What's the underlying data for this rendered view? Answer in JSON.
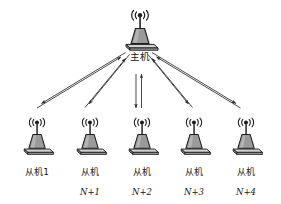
{
  "diagram": {
    "type": "star-network-topology",
    "background_color": "#ffffff",
    "line_color": "#2b2b2b",
    "icon_body_color": "#9a9a9a",
    "icon_base_color": "#c9c9c9",
    "icon_outline_color": "#1e1e1e",
    "master": {
      "id": "master",
      "label": "主机",
      "icon": "wireless-base-station-icon"
    },
    "slaves": [
      {
        "id": "slave-1",
        "label_line1": "从机1",
        "label_line2": "",
        "icon": "wireless-base-station-icon"
      },
      {
        "id": "slave-n1",
        "label_line1": "从机",
        "label_line2": "N+1",
        "icon": "wireless-base-station-icon"
      },
      {
        "id": "slave-n2",
        "label_line1": "从机",
        "label_line2": "N+2",
        "icon": "wireless-base-station-icon"
      },
      {
        "id": "slave-n3",
        "label_line1": "从机",
        "label_line2": "N+3",
        "icon": "wireless-base-station-icon"
      },
      {
        "id": "slave-n4",
        "label_line1": "从机",
        "label_line2": "N+4",
        "icon": "wireless-base-station-icon"
      }
    ],
    "links": [
      {
        "from": "master",
        "to": "slave-1",
        "style": "double-arrow-pair",
        "direction": "bidirectional"
      },
      {
        "from": "master",
        "to": "slave-n1",
        "style": "double-arrow-pair",
        "direction": "bidirectional"
      },
      {
        "from": "master",
        "to": "slave-n2",
        "style": "double-arrow-pair",
        "direction": "bidirectional"
      },
      {
        "from": "master",
        "to": "slave-n3",
        "style": "double-arrow-pair",
        "direction": "bidirectional"
      },
      {
        "from": "master",
        "to": "slave-n4",
        "style": "double-arrow-pair",
        "direction": "bidirectional"
      }
    ]
  }
}
